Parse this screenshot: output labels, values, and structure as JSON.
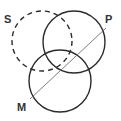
{
  "diagram": {
    "type": "venn-syllogism",
    "colors": {
      "stroke": "#2b2b2b",
      "line": "#6e6e6e",
      "label": "#333333",
      "background": "#ffffff"
    },
    "circles": [
      {
        "id": "S",
        "label": "S",
        "style": "dashed",
        "cx": 42,
        "cy": 41,
        "r": 30
      },
      {
        "id": "P",
        "label": "P",
        "style": "solid",
        "cx": 74,
        "cy": 42,
        "r": 31
      },
      {
        "id": "M",
        "label": "M",
        "style": "solid",
        "cx": 60,
        "cy": 81,
        "r": 31
      }
    ],
    "labels": {
      "S": "S",
      "P": "P",
      "M": "M"
    },
    "diagonal_line": {
      "x1": 30,
      "y1": 99,
      "x2": 106,
      "y2": 28
    }
  }
}
